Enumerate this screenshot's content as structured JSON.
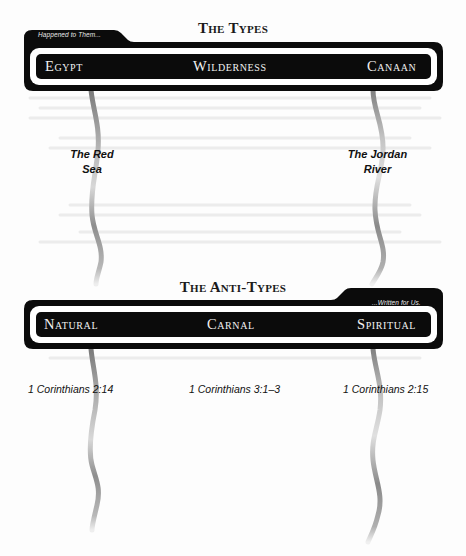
{
  "types": {
    "title": "The Types",
    "tab_caption": "Happened to Them...",
    "stages": [
      "Egypt",
      "Wilderness",
      "Canaan"
    ],
    "crossings": [
      {
        "line1": "The Red",
        "line2": "Sea"
      },
      {
        "line1": "The Jordan",
        "line2": "River"
      }
    ]
  },
  "antitypes": {
    "title": "The Anti-Types",
    "tab_caption": "...Written for Us.",
    "stages": [
      "Natural",
      "Carnal",
      "Spiritual"
    ],
    "references": [
      "1 Corinthians 2:14",
      "1 Corinthians 3:1–3",
      "1 Corinthians 2:15"
    ]
  },
  "colors": {
    "bar": "#0b0b0b",
    "inner_band": "#ffffff",
    "river": "#8a8a8a",
    "text_dark": "#111111",
    "text_light": "#f2f2f2"
  }
}
